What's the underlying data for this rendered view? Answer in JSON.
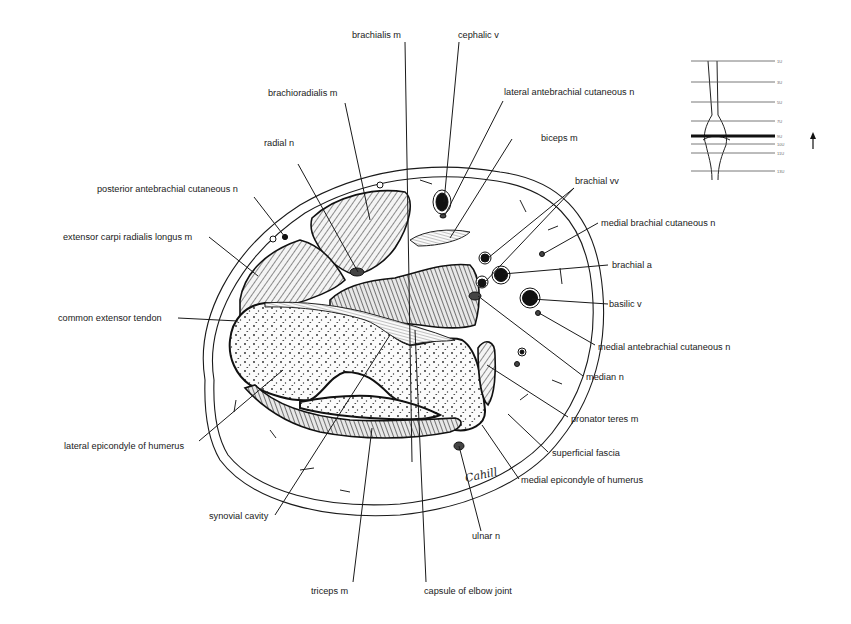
{
  "figure": {
    "type": "anatomical cross-section",
    "signature": "Cahill"
  },
  "labels": {
    "brachialis_m": "brachialis m",
    "cephalic_v": "cephalic v",
    "brachioradialis_m": "brachioradialis m",
    "lateral_antebrachial_cutaneous_n": "lateral antebrachial cutaneous n",
    "radial_n": "radial n",
    "biceps_m": "biceps m",
    "posterior_antebrachial_cutaneous_n": "posterior antebrachial cutaneous n",
    "brachial_vv": "brachial vv",
    "medial_brachial_cutaneous_n": "medial brachial cutaneous n",
    "extensor_carpi_radialis_longus_m": "extensor carpi radialis longus m",
    "brachial_a": "brachial a",
    "basilic_v": "basilic v",
    "common_extensor_tendon": "common extensor tendon",
    "medial_antebrachial_cutaneous_n": "medial antebrachial cutaneous n",
    "median_n": "median n",
    "pronator_teres_m": "pronator teres m",
    "lateral_epicondyle_of_humerus": "lateral epicondyle of humerus",
    "superficial_fascia": "superficial fascia",
    "medial_epicondyle_of_humerus": "medial epicondyle of humerus",
    "synovial_cavity": "synovial cavity",
    "ulnar_n": "ulnar n",
    "triceps_m": "triceps m",
    "capsule_of_elbow_joint": "capsule of elbow joint"
  },
  "inset": {
    "description": "level locator of section along arm",
    "levels": [
      "1U",
      "3U",
      "5U",
      "7U",
      "9U",
      "10U",
      "11U",
      "13U"
    ],
    "highlighted_level": "9U",
    "orientation_arrow": "up-arrow"
  },
  "colors": {
    "ink": "#1a1a1a",
    "background": "#ffffff"
  }
}
